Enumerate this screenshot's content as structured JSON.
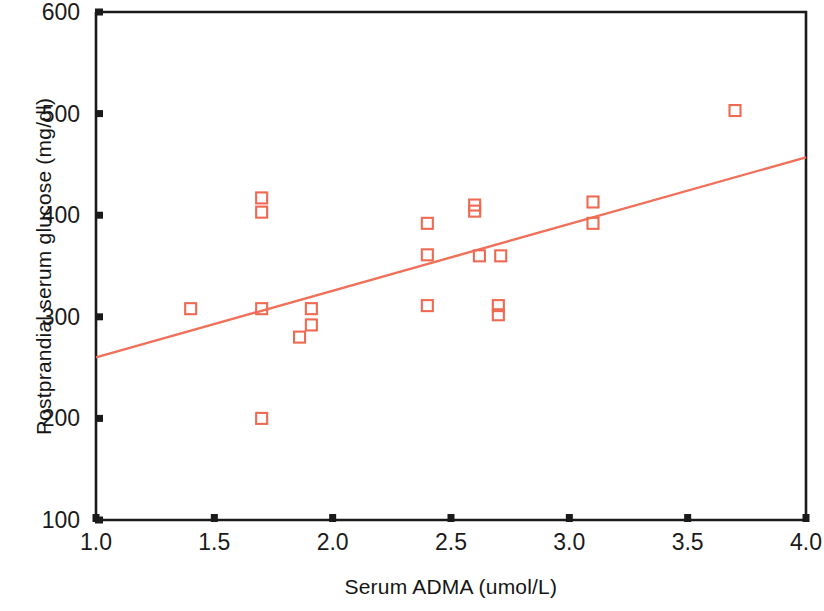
{
  "chart_data": {
    "type": "scatter",
    "title": "",
    "xlabel": "Serum ADMA (umol/L)",
    "ylabel": "Postprandial serum glucose (mg/dl)",
    "xlim": [
      1.0,
      4.0
    ],
    "ylim": [
      100,
      600
    ],
    "xticks": [
      "1.0",
      "1.5",
      "2.0",
      "2.5",
      "3.0",
      "3.5",
      "4.0"
    ],
    "xtick_values": [
      1.0,
      1.5,
      2.0,
      2.5,
      3.0,
      3.5,
      4.0
    ],
    "yticks": [
      "100",
      "200",
      "300",
      "400",
      "500",
      "600"
    ],
    "ytick_values": [
      100,
      200,
      300,
      400,
      500,
      600
    ],
    "grid": false,
    "legend": false,
    "marker": "open-square",
    "marker_color": "#ef6a52",
    "line_color": "#f0705a",
    "axis_color": "#1a1a1a",
    "points": [
      {
        "x": 1.4,
        "y": 308
      },
      {
        "x": 1.7,
        "y": 417
      },
      {
        "x": 1.7,
        "y": 403
      },
      {
        "x": 1.7,
        "y": 308
      },
      {
        "x": 1.7,
        "y": 200
      },
      {
        "x": 1.86,
        "y": 280
      },
      {
        "x": 1.91,
        "y": 308
      },
      {
        "x": 1.91,
        "y": 292
      },
      {
        "x": 2.4,
        "y": 392
      },
      {
        "x": 2.4,
        "y": 361
      },
      {
        "x": 2.4,
        "y": 311
      },
      {
        "x": 2.6,
        "y": 410
      },
      {
        "x": 2.6,
        "y": 404
      },
      {
        "x": 2.62,
        "y": 360
      },
      {
        "x": 2.71,
        "y": 360
      },
      {
        "x": 2.7,
        "y": 311
      },
      {
        "x": 2.7,
        "y": 302
      },
      {
        "x": 3.1,
        "y": 413
      },
      {
        "x": 3.1,
        "y": 392
      },
      {
        "x": 3.7,
        "y": 503
      }
    ],
    "trendline": {
      "name": "linear fit",
      "x_start": 1.0,
      "y_start": 260,
      "x_end": 4.0,
      "y_end": 457
    }
  }
}
